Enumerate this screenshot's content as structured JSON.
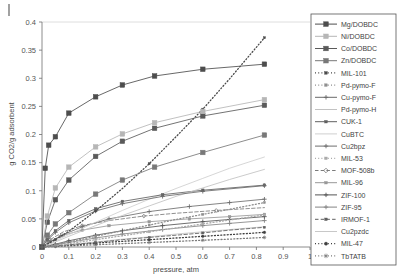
{
  "chart_data": {
    "type": "line",
    "title": "",
    "xlabel": "pressure, atm",
    "ylabel": "g CO2/g adsorbent",
    "xlim": [
      0,
      1
    ],
    "ylim": [
      0,
      0.4
    ],
    "xticks": [
      "0",
      "0.1",
      "0.2",
      "0.3",
      "0.4",
      "0.5",
      "0.6",
      "0.7",
      "0.8",
      "0.9",
      "1"
    ],
    "yticks": [
      "0",
      "0.05",
      "0.1",
      "0.15",
      "0.2",
      "0.25",
      "0.3",
      "0.35",
      "0.4"
    ],
    "grid": "horizontal-top-only",
    "legend_position": "right",
    "series": [
      {
        "name": "Mg/DOBDC",
        "color": "#4d4d4d",
        "marker": "square-filled",
        "dash": "solid",
        "x": [
          0,
          0.012,
          0.025,
          0.05,
          0.1,
          0.2,
          0.3,
          0.42,
          0.6,
          0.83
        ],
        "y": [
          0,
          0.14,
          0.181,
          0.196,
          0.238,
          0.267,
          0.288,
          0.304,
          0.316,
          0.325
        ]
      },
      {
        "name": "Ni/DOBDC",
        "color": "#b6b6b6",
        "marker": "square-filled",
        "dash": "solid",
        "x": [
          0,
          0.02,
          0.05,
          0.1,
          0.2,
          0.3,
          0.42,
          0.6,
          0.83
        ],
        "y": [
          0,
          0.055,
          0.105,
          0.142,
          0.178,
          0.201,
          0.221,
          0.241,
          0.262
        ]
      },
      {
        "name": "Co/DOBDC",
        "color": "#5a5a5a",
        "marker": "square-filled",
        "dash": "solid",
        "x": [
          0,
          0.02,
          0.05,
          0.1,
          0.2,
          0.3,
          0.42,
          0.6,
          0.83
        ],
        "y": [
          0,
          0.044,
          0.084,
          0.119,
          0.161,
          0.188,
          0.211,
          0.233,
          0.252
        ]
      },
      {
        "name": "Zn/DOBDC",
        "color": "#787878",
        "marker": "square-filled",
        "dash": "solid",
        "x": [
          0,
          0.02,
          0.05,
          0.1,
          0.2,
          0.3,
          0.42,
          0.6,
          0.83
        ],
        "y": [
          0,
          0.021,
          0.041,
          0.061,
          0.094,
          0.119,
          0.142,
          0.168,
          0.199
        ]
      },
      {
        "name": "MIL-101",
        "color": "#4a4a4a",
        "marker": "square-small",
        "dash": "dotted",
        "x": [
          0,
          0.05,
          0.1,
          0.2,
          0.3,
          0.4,
          0.5,
          0.6,
          0.7,
          0.83
        ],
        "y": [
          0,
          0.013,
          0.028,
          0.064,
          0.104,
          0.148,
          0.196,
          0.245,
          0.299,
          0.372
        ]
      },
      {
        "name": "Pd-pymo-F",
        "color": "#8f8f8f",
        "marker": "square-small",
        "dash": "dotted",
        "x": [
          0,
          0.05,
          0.1,
          0.2,
          0.3,
          0.4,
          0.5,
          0.6,
          0.7,
          0.83
        ],
        "y": [
          0,
          0.004,
          0.009,
          0.019,
          0.029,
          0.039,
          0.049,
          0.058,
          0.067,
          0.079
        ]
      },
      {
        "name": "Cu-pymo-F",
        "color": "#6a6a6a",
        "marker": "plus",
        "dash": "solid",
        "x": [
          0,
          0.02,
          0.05,
          0.1,
          0.2,
          0.3,
          0.45,
          0.6,
          0.83
        ],
        "y": [
          0,
          0.012,
          0.026,
          0.043,
          0.064,
          0.077,
          0.09,
          0.099,
          0.109
        ]
      },
      {
        "name": "Pd-pymo-H",
        "color": "#c2c2c2",
        "marker": "none",
        "dash": "solid",
        "x": [
          0,
          0.05,
          0.1,
          0.2,
          0.3,
          0.4,
          0.5,
          0.6,
          0.7,
          0.83
        ],
        "y": [
          0,
          0.009,
          0.019,
          0.038,
          0.056,
          0.073,
          0.09,
          0.105,
          0.12,
          0.138
        ]
      },
      {
        "name": "CUK-1",
        "color": "#606060",
        "marker": "square-small",
        "dash": "solid",
        "x": [
          0,
          0.02,
          0.05,
          0.1,
          0.2,
          0.3,
          0.45,
          0.6,
          0.83
        ],
        "y": [
          0,
          0.014,
          0.029,
          0.047,
          0.068,
          0.081,
          0.093,
          0.101,
          0.11
        ]
      },
      {
        "name": "CuBTC",
        "color": "#cfcfcf",
        "marker": "none",
        "dash": "solid",
        "x": [
          0,
          0.05,
          0.1,
          0.2,
          0.3,
          0.4,
          0.5,
          0.6,
          0.7,
          0.83
        ],
        "y": [
          0,
          0.011,
          0.022,
          0.044,
          0.065,
          0.085,
          0.104,
          0.122,
          0.14,
          0.16
        ]
      },
      {
        "name": "Cu2bpz",
        "color": "#6e6e6e",
        "marker": "plus",
        "dash": "solid",
        "x": [
          0,
          0.03,
          0.07,
          0.15,
          0.25,
          0.4,
          0.55,
          0.7,
          0.83
        ],
        "y": [
          0,
          0.009,
          0.02,
          0.036,
          0.05,
          0.063,
          0.072,
          0.079,
          0.085
        ]
      },
      {
        "name": "MIL-53",
        "color": "#aaaaaa",
        "marker": "square-small",
        "dash": "dotted",
        "x": [
          0,
          0.05,
          0.1,
          0.2,
          0.3,
          0.4,
          0.5,
          0.6,
          0.7,
          0.83
        ],
        "y": [
          0,
          0.003,
          0.006,
          0.013,
          0.02,
          0.027,
          0.034,
          0.041,
          0.048,
          0.057
        ]
      },
      {
        "name": "MOF-508b",
        "color": "#7b7b7b",
        "marker": "diamond",
        "dash": "dashed",
        "x": [
          0,
          0.03,
          0.08,
          0.15,
          0.25,
          0.38,
          0.5,
          0.65,
          0.83
        ],
        "y": [
          0,
          0.013,
          0.027,
          0.038,
          0.047,
          0.055,
          0.06,
          0.065,
          0.07
        ]
      },
      {
        "name": "MIL-96",
        "color": "#989898",
        "marker": "square-small",
        "dash": "solid",
        "x": [
          0,
          0.03,
          0.08,
          0.15,
          0.25,
          0.4,
          0.55,
          0.7,
          0.83
        ],
        "y": [
          0,
          0.01,
          0.021,
          0.03,
          0.038,
          0.045,
          0.05,
          0.054,
          0.058
        ]
      },
      {
        "name": "ZIF-100",
        "color": "#555555",
        "marker": "plus",
        "dash": "solid",
        "x": [
          0,
          0.05,
          0.1,
          0.2,
          0.3,
          0.45,
          0.6,
          0.7,
          0.83
        ],
        "y": [
          0,
          0.005,
          0.011,
          0.021,
          0.029,
          0.038,
          0.045,
          0.049,
          0.054
        ]
      },
      {
        "name": "ZIF-95",
        "color": "#848484",
        "marker": "plus",
        "dash": "solid",
        "x": [
          0,
          0.05,
          0.1,
          0.2,
          0.3,
          0.45,
          0.6,
          0.7,
          0.83
        ],
        "y": [
          0,
          0.004,
          0.008,
          0.016,
          0.023,
          0.031,
          0.038,
          0.042,
          0.047
        ]
      },
      {
        "name": "IRMOF-1",
        "color": "#5f5f5f",
        "marker": "square-small",
        "dash": "dashed",
        "x": [
          0,
          0.05,
          0.1,
          0.2,
          0.3,
          0.4,
          0.5,
          0.6,
          0.7,
          0.83
        ],
        "y": [
          0,
          0.002,
          0.004,
          0.008,
          0.013,
          0.017,
          0.021,
          0.025,
          0.03,
          0.035
        ]
      },
      {
        "name": "Cu2pzdc",
        "color": "#c8c8c8",
        "marker": "none",
        "dash": "solid",
        "x": [
          0,
          0.05,
          0.1,
          0.2,
          0.3,
          0.4,
          0.5,
          0.6,
          0.7,
          0.83
        ],
        "y": [
          0,
          0.002,
          0.004,
          0.009,
          0.014,
          0.018,
          0.023,
          0.027,
          0.031,
          0.036
        ]
      },
      {
        "name": "MIL-47",
        "color": "#3f3f3f",
        "marker": "circle-filled",
        "dash": "dotted",
        "x": [
          0,
          0.05,
          0.1,
          0.2,
          0.3,
          0.4,
          0.5,
          0.6,
          0.7,
          0.83
        ],
        "y": [
          0,
          0.002,
          0.003,
          0.007,
          0.01,
          0.013,
          0.016,
          0.019,
          0.022,
          0.026
        ]
      },
      {
        "name": "TbTATB",
        "color": "#7a7a7a",
        "marker": "star",
        "dash": "dotted",
        "x": [
          0,
          0.05,
          0.1,
          0.2,
          0.3,
          0.4,
          0.5,
          0.6,
          0.7,
          0.83
        ],
        "y": [
          0,
          0.001,
          0.002,
          0.004,
          0.006,
          0.008,
          0.01,
          0.012,
          0.014,
          0.017
        ]
      }
    ]
  }
}
